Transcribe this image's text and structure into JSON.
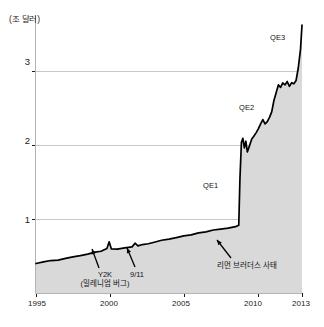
{
  "chart_data": {
    "type": "area",
    "title": "",
    "subtitle": "",
    "xlabel": "",
    "ylabel": "(조 달러)",
    "ylabel_full": "(조 달러)",
    "xlim": [
      1995,
      2013
    ],
    "ylim": [
      0,
      3.75
    ],
    "grid": true,
    "legend_position": "none",
    "x_ticks": [
      "1995",
      "2000",
      "2005",
      "2010",
      "2013"
    ],
    "x_tick_values": [
      1995,
      2000,
      2005,
      2010,
      2013
    ],
    "y_ticks": [
      "1",
      "2",
      "3"
    ],
    "y_tick_values": [
      1,
      2,
      3
    ],
    "series_name": "Federal Reserve Balance Sheet",
    "x": [
      1995.0,
      1995.5,
      1996.0,
      1996.5,
      1997.0,
      1997.5,
      1998.0,
      1998.5,
      1999.0,
      1999.4,
      1999.8,
      1999.95,
      2000.1,
      2000.5,
      2001.0,
      2001.5,
      2001.7,
      2001.9,
      2002.2,
      2002.6,
      2003.0,
      2003.5,
      2004.0,
      2004.5,
      2005.0,
      2005.5,
      2006.0,
      2006.5,
      2007.0,
      2007.5,
      2008.0,
      2008.5,
      2008.72,
      2008.8,
      2008.9,
      2009.0,
      2009.1,
      2009.2,
      2009.3,
      2009.45,
      2009.6,
      2009.75,
      2009.9,
      2010.05,
      2010.2,
      2010.35,
      2010.5,
      2010.65,
      2010.8,
      2010.95,
      2011.1,
      2011.25,
      2011.4,
      2011.55,
      2011.7,
      2011.85,
      2012.0,
      2012.15,
      2012.3,
      2012.45,
      2012.6,
      2012.75,
      2012.9,
      2013.0
    ],
    "values": [
      0.4,
      0.42,
      0.44,
      0.45,
      0.47,
      0.49,
      0.51,
      0.53,
      0.55,
      0.57,
      0.6,
      0.69,
      0.6,
      0.59,
      0.61,
      0.62,
      0.67,
      0.64,
      0.66,
      0.67,
      0.69,
      0.71,
      0.73,
      0.75,
      0.77,
      0.79,
      0.81,
      0.83,
      0.85,
      0.86,
      0.88,
      0.9,
      0.92,
      1.55,
      2.05,
      2.1,
      1.95,
      2.05,
      1.9,
      2.0,
      2.08,
      2.12,
      2.18,
      2.22,
      2.3,
      2.35,
      2.28,
      2.32,
      2.38,
      2.45,
      2.6,
      2.72,
      2.82,
      2.78,
      2.85,
      2.82,
      2.86,
      2.8,
      2.84,
      2.82,
      2.88,
      3.05,
      3.3,
      3.62
    ],
    "annotations": [
      {
        "id": "y2k",
        "label": "Y2K",
        "sublabel": "(밀레니엄 버그)",
        "x_value": 1999.95,
        "y_value": 0.69
      },
      {
        "id": "sept11",
        "label": "9/11",
        "sublabel": "",
        "x_value": 2001.7,
        "y_value": 0.67
      },
      {
        "id": "lehman",
        "label": "리먼 브러더스 사태",
        "sublabel": "",
        "x_value": 2008.72,
        "y_value": 0.92
      },
      {
        "id": "qe1",
        "label": "QE1",
        "sublabel": "",
        "x_value": 2008.9,
        "y_value": 1.35
      },
      {
        "id": "qe2",
        "label": "QE2",
        "sublabel": "",
        "x_value": 2010.6,
        "y_value": 2.45
      },
      {
        "id": "qe3",
        "label": "QE3",
        "sublabel": "",
        "x_value": 2012.6,
        "y_value": 3.25
      }
    ],
    "colors": {
      "line": "#000000",
      "fill": "#d9d9d9",
      "grid": "#c8c8c8",
      "axis": "#b4b4b4",
      "text": "#1a1a1a",
      "background": "#ffffff"
    }
  }
}
